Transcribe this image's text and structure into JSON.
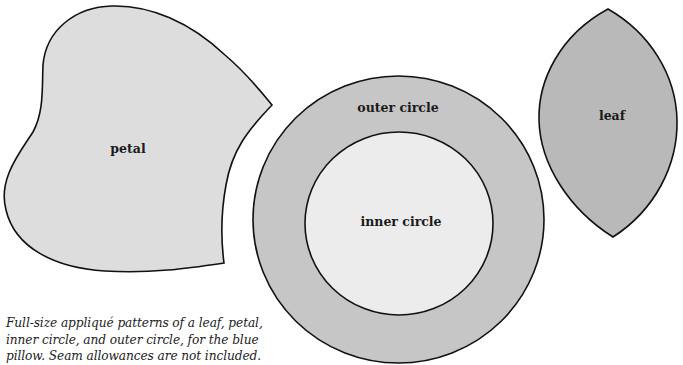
{
  "figure": {
    "shapes": [
      {
        "id": "petal",
        "label": "petal",
        "fill": "#dddddd"
      },
      {
        "id": "outer-circle",
        "label": "outer circle",
        "fill": "#c6c6c6"
      },
      {
        "id": "inner-circle",
        "label": "inner circle",
        "fill": "#ececec"
      },
      {
        "id": "leaf",
        "label": "leaf",
        "fill": "#b9b9b9"
      }
    ],
    "stroke_color": "#111111",
    "caption": {
      "lines": [
        "Full-size appliqué patterns of a leaf, petal,",
        "inner circle, and outer circle, for the blue",
        "pillow. Seam allowances are not included."
      ]
    }
  }
}
